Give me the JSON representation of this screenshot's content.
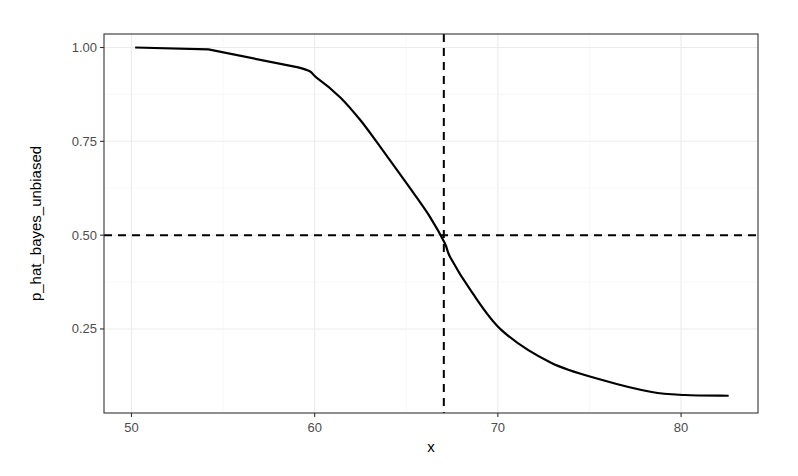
{
  "chart_data": {
    "type": "line",
    "title": "",
    "xlabel": "x",
    "ylabel": "p_hat_bayes_unbiased",
    "xlim": [
      48.5,
      84.2
    ],
    "ylim": [
      0.026,
      1.036
    ],
    "x_ticks": [
      50,
      60,
      70,
      80
    ],
    "x_tick_labels": [
      "50",
      "60",
      "70",
      "80"
    ],
    "y_ticks": [
      0.25,
      0.5,
      0.75,
      1.0
    ],
    "y_tick_labels": [
      "0.25",
      "0.50",
      "0.75",
      "1.00"
    ],
    "grid": true,
    "legend": "none",
    "series": [
      {
        "name": "p_hat_bayes_unbiased",
        "style": "solid",
        "color": "#000000",
        "x": [
          50.2,
          54.2,
          59.1,
          60.1,
          61.4,
          62.5,
          63.6,
          64.5,
          65.4,
          66.3,
          67.1,
          67.4,
          68.5,
          70.2,
          72.9,
          75.7,
          78.4,
          80.2,
          82.6
        ],
        "y": [
          1.0,
          0.995,
          0.947,
          0.92,
          0.867,
          0.806,
          0.734,
          0.673,
          0.612,
          0.548,
          0.479,
          0.441,
          0.354,
          0.247,
          0.16,
          0.114,
          0.082,
          0.074,
          0.072
        ]
      }
    ],
    "reference_lines": [
      {
        "orientation": "horizontal",
        "value": 0.5,
        "style": "dashed",
        "color": "#000000"
      },
      {
        "orientation": "vertical",
        "value": 67.05,
        "style": "dashed",
        "color": "#000000"
      }
    ]
  }
}
